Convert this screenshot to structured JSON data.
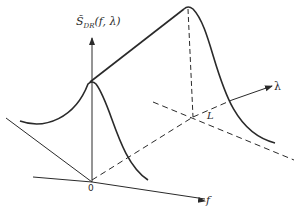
{
  "diagram": {
    "labels": {
      "y_axis": "S̃",
      "y_axis_sub": "DR",
      "y_axis_args": "(f, λ)",
      "origin": "0",
      "f_axis": "f",
      "lambda_axis": "λ",
      "L_mark": "L"
    },
    "colors": {
      "line": "#2a2a2a",
      "background": "#ffffff"
    },
    "elements": [
      {
        "type": "axis",
        "name": "vertical-axis",
        "label": "S̃_DR(f, λ)"
      },
      {
        "type": "axis",
        "name": "f-axis",
        "label": "f"
      },
      {
        "type": "axis",
        "name": "lambda-axis",
        "label": "λ",
        "style": "dashed then solid"
      },
      {
        "type": "curve",
        "name": "spectrum-at-lambda-0",
        "peak_at": "f = 0"
      },
      {
        "type": "curve",
        "name": "spectrum-at-lambda-L",
        "peak_at": "f = 0, λ = L"
      },
      {
        "type": "line",
        "name": "ridge-line",
        "connects": "peaks"
      },
      {
        "type": "dashed-line",
        "name": "vertical-drop-at-L"
      },
      {
        "type": "dashed-line",
        "name": "f-parallel-at-L"
      }
    ]
  }
}
